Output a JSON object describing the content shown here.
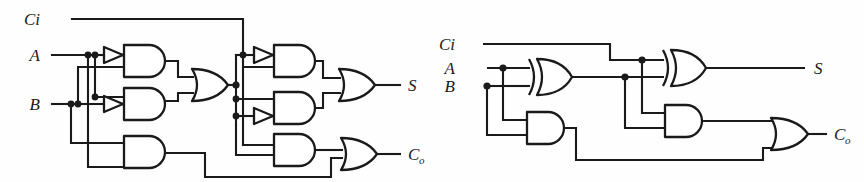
{
  "figure": {
    "background_color": "#fefefe",
    "line_color": "#1a1a1a",
    "width": 864,
    "height": 182
  },
  "circuits": [
    {
      "id": "gate-level-full-adder",
      "name": "NAND/AND-OR gate level full adder",
      "inputs": [
        {
          "label": "Ci",
          "name": "carry-in"
        },
        {
          "label": "A",
          "name": "input-a"
        },
        {
          "label": "B",
          "name": "input-b"
        }
      ],
      "outputs": [
        {
          "label": "S",
          "name": "sum-output"
        },
        {
          "label": "C",
          "sub": "o",
          "name": "carry-out"
        }
      ],
      "gates": [
        {
          "type": "inverter",
          "name": "inverter-a-1"
        },
        {
          "type": "inverter",
          "name": "inverter-b-1"
        },
        {
          "type": "and",
          "name": "and-gate-1"
        },
        {
          "type": "and",
          "name": "and-gate-2"
        },
        {
          "type": "and",
          "name": "and-gate-3"
        },
        {
          "type": "or",
          "name": "or-gate-1"
        },
        {
          "type": "inverter",
          "name": "inverter-a-2"
        },
        {
          "type": "inverter",
          "name": "inverter-b-2"
        },
        {
          "type": "and",
          "name": "and-gate-4"
        },
        {
          "type": "and",
          "name": "and-gate-5"
        },
        {
          "type": "and",
          "name": "and-gate-6"
        },
        {
          "type": "or",
          "name": "or-gate-2"
        },
        {
          "type": "or",
          "name": "or-gate-3"
        }
      ]
    },
    {
      "id": "xor-level-full-adder",
      "name": "XOR based full adder",
      "inputs": [
        {
          "label": "Ci",
          "name": "carry-in"
        },
        {
          "label": "A",
          "name": "input-a"
        },
        {
          "label": "B",
          "name": "input-b"
        }
      ],
      "outputs": [
        {
          "label": "S",
          "name": "sum-output"
        },
        {
          "label": "C",
          "sub": "o",
          "name": "carry-out"
        }
      ],
      "gates": [
        {
          "type": "xor",
          "name": "xor-gate-1"
        },
        {
          "type": "xor",
          "name": "xor-gate-2"
        },
        {
          "type": "and",
          "name": "and-gate-1"
        },
        {
          "type": "and",
          "name": "and-gate-2"
        },
        {
          "type": "or",
          "name": "or-gate-1"
        }
      ]
    }
  ],
  "labels": {
    "left": {
      "ci": "Ci",
      "a": "A",
      "b": "B",
      "s": "S",
      "co": "C",
      "co_sub": "o"
    },
    "right": {
      "ci": "Ci",
      "a": "A",
      "b": "B",
      "s": "S",
      "co": "C",
      "co_sub": "o"
    }
  }
}
